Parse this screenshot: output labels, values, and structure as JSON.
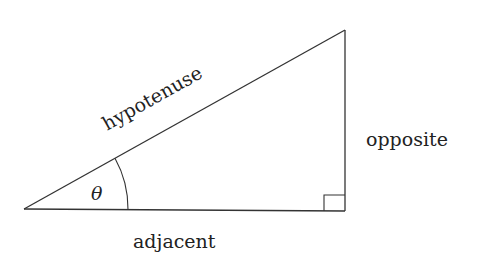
{
  "diagram": {
    "type": "right-triangle",
    "labels": {
      "hypotenuse": "hypotenuse",
      "opposite": "opposite",
      "adjacent": "adjacent",
      "angle": "θ"
    },
    "vertices": {
      "angle_vertex": [
        24,
        209
      ],
      "right_angle_vertex": [
        345,
        211
      ],
      "top_vertex": [
        345,
        30
      ]
    },
    "right_angle_marker": true,
    "angle_arc": true,
    "colors": {
      "stroke": "#333333",
      "text": "#222222",
      "background": "#ffffff"
    }
  }
}
